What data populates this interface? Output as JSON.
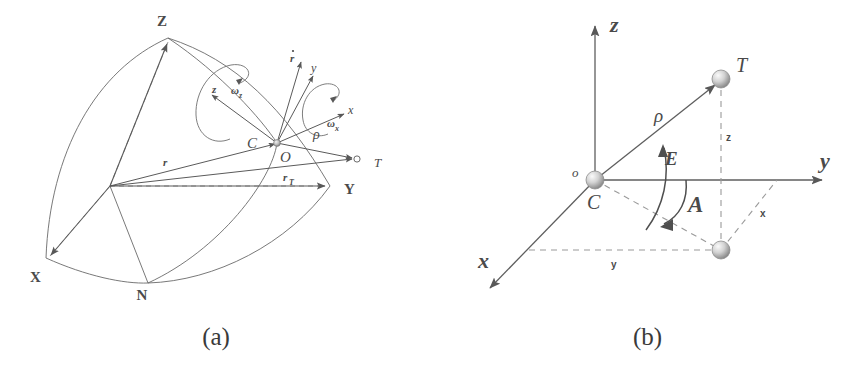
{
  "figure": {
    "panels": [
      {
        "id": "a",
        "caption": "(a)",
        "labels": {
          "axis_Z": "Z",
          "axis_Y": "Y",
          "axis_X": "X",
          "node_N": "N",
          "point_C": "C",
          "point_O": "O",
          "point_T": "T",
          "vector_r": "r",
          "vector_rT": "r",
          "vector_rT_sub": "T",
          "vector_rho": "ρ",
          "body_axis_z": "z",
          "body_axis_y": "y",
          "body_axis_x": "x",
          "rdot": "r",
          "omega_z": "ω",
          "omega_z_sub": "z",
          "omega_x": "ω",
          "omega_x_sub": "x"
        }
      },
      {
        "id": "b",
        "caption": "(b)",
        "labels": {
          "axis_z": "z",
          "axis_y": "y",
          "axis_x": "x",
          "origin_o": "o",
          "origin_C": "C",
          "target_T": "T",
          "range_rho": "ρ",
          "elevation_E": "E",
          "azimuth_A": "A",
          "comp_z": "z",
          "comp_x": "x",
          "comp_y": "y"
        }
      }
    ]
  },
  "style": {
    "stroke": "#5a5a5a",
    "stroke_light": "#7d7d7d",
    "dash": "#8a8a8a",
    "text": "#4a4a4a",
    "background": "#ffffff"
  }
}
